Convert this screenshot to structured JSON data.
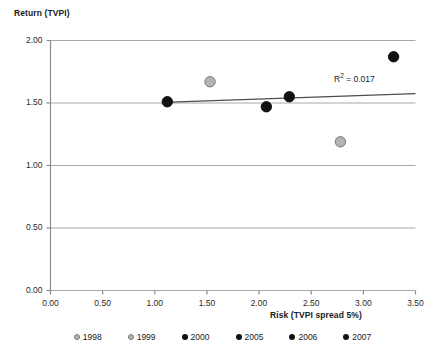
{
  "chart_data": {
    "type": "scatter",
    "title": "",
    "xlabel": "Risk (TVPI spread 5%)",
    "ylabel": "Return (TVPI)",
    "xlim": [
      0.0,
      3.5
    ],
    "ylim": [
      0.0,
      2.0
    ],
    "xticks": [
      "0.00",
      "0.50",
      "1.00",
      "1.50",
      "2.00",
      "2.50",
      "3.00",
      "3.50"
    ],
    "yticks": [
      "0.00",
      "0.50",
      "1.00",
      "1.50",
      "2.00"
    ],
    "xtick_values": [
      0.0,
      0.5,
      1.0,
      1.5,
      2.0,
      2.5,
      3.0,
      3.5
    ],
    "ytick_values": [
      0.0,
      0.5,
      1.0,
      1.5,
      2.0
    ],
    "grid": "horizontal",
    "legend_position": "bottom",
    "annotation": "R² = 0.017",
    "annotation_r2_value": 0.017,
    "trendline": {
      "x_start": 1.08,
      "y_start": 1.505,
      "x_end": 3.5,
      "y_end": 1.575,
      "color": "#4d4d4d"
    },
    "series": [
      {
        "name": "1998",
        "x": 1.53,
        "y": 1.67,
        "color": "#b3b3b3",
        "edge": "#7a7a7a"
      },
      {
        "name": "1999",
        "x": 2.78,
        "y": 1.19,
        "color": "#b3b3b3",
        "edge": "#7a7a7a"
      },
      {
        "name": "2000",
        "x": 1.12,
        "y": 1.51,
        "color": "#111111",
        "edge": "#111111"
      },
      {
        "name": "2005",
        "x": 2.07,
        "y": 1.47,
        "color": "#111111",
        "edge": "#111111"
      },
      {
        "name": "2006",
        "x": 2.29,
        "y": 1.55,
        "color": "#111111",
        "edge": "#111111"
      },
      {
        "name": "2007",
        "x": 3.29,
        "y": 1.87,
        "color": "#111111",
        "edge": "#111111"
      }
    ]
  },
  "axes": {
    "y_title": "Return (TVPI)",
    "x_title": "Risk (TVPI spread 5%)"
  },
  "legend": {
    "items": [
      {
        "label": "1998",
        "color": "#b3b3b3"
      },
      {
        "label": "1999",
        "color": "#b3b3b3"
      },
      {
        "label": "2000",
        "color": "#111111"
      },
      {
        "label": "2005",
        "color": "#111111"
      },
      {
        "label": "2006",
        "color": "#111111"
      },
      {
        "label": "2007",
        "color": "#111111"
      }
    ]
  },
  "colors": {
    "gridline": "#a8a8a8",
    "axis": "#8c8c8c",
    "marker_dark": "#111111",
    "marker_light": "#b3b3b3",
    "trendline": "#4d4d4d",
    "background": "#ffffff"
  }
}
